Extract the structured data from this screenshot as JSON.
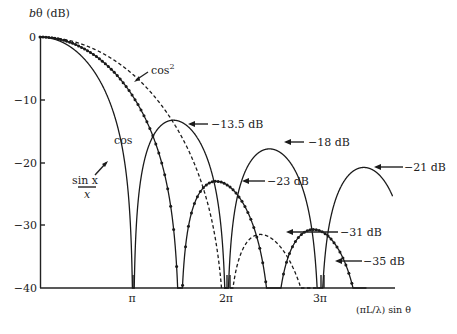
{
  "chart_data": {
    "type": "line",
    "title": "",
    "ylabel": "bθ (dB)",
    "xlabel": "(πL/λ) sin θ",
    "ylim": [
      -40,
      0
    ],
    "xlim_pi": [
      0,
      3.75
    ],
    "grid": false,
    "y_ticks": [
      {
        "value": 0,
        "label": "0"
      },
      {
        "value": -10,
        "label": "−10"
      },
      {
        "value": -20,
        "label": "−20"
      },
      {
        "value": -30,
        "label": "−30"
      },
      {
        "value": -40,
        "label": "−40"
      }
    ],
    "x_ticks": [
      {
        "value_pi": 1,
        "label": "π"
      },
      {
        "value_pi": 2,
        "label": "2π"
      },
      {
        "value_pi": 3,
        "label": "3π"
      }
    ],
    "series": [
      {
        "name": "sin x / x",
        "style": "solid",
        "label": "sin x / x",
        "nulls_pi": [
          1,
          2,
          3
        ],
        "sidelobe_peaks_dB": [
          -13.5,
          -18,
          -21
        ],
        "sidelobe_peaks_x_pi": [
          1.43,
          2.46,
          3.47
        ]
      },
      {
        "name": "cos",
        "style": "solid-with-dots",
        "label": "cos",
        "nulls_pi": [
          1.5,
          2.5,
          3.5
        ],
        "sidelobe_peaks_dB": [
          -23,
          -35
        ],
        "sidelobe_peaks_x_pi": [
          2.0,
          3.0
        ]
      },
      {
        "name": "cos²",
        "style": "dashed",
        "label": "cos²",
        "nulls_pi": [
          2,
          3
        ],
        "sidelobe_peaks_dB": [
          -31
        ],
        "sidelobe_peaks_x_pi": [
          2.5
        ]
      }
    ],
    "annotations": [
      {
        "text": "−13.5 dB",
        "x_pi": 1.43,
        "y": -13.5
      },
      {
        "text": "−18 dB",
        "x_pi": 2.46,
        "y": -18
      },
      {
        "text": "−21 dB",
        "x_pi": 3.47,
        "y": -21
      },
      {
        "text": "−23 dB",
        "x_pi": 2.0,
        "y": -23
      },
      {
        "text": "−31 dB",
        "x_pi": 2.5,
        "y": -31
      },
      {
        "text": "−35 dB",
        "x_pi": 3.0,
        "y": -35
      }
    ]
  },
  "labels": {
    "ylabel_b": "b",
    "ylabel_rest": "θ (dB)",
    "xlabel": "(πL/λ) sin θ",
    "cos2_label": "cos",
    "cos2_sup": "2",
    "cos_label": "cos",
    "sinc_num": "sin x",
    "sinc_den": "x",
    "ann_13_5": "−13.5 dB",
    "ann_18": "−18 dB",
    "ann_21": "−21 dB",
    "ann_23": "−23 dB",
    "ann_31": "−31 dB",
    "ann_35": "−35 dB",
    "y0": "0",
    "y10": "−10",
    "y20": "−20",
    "y30": "−30",
    "y40": "−40",
    "xpi": "π",
    "x2pi": "2π",
    "x3pi": "3π"
  }
}
